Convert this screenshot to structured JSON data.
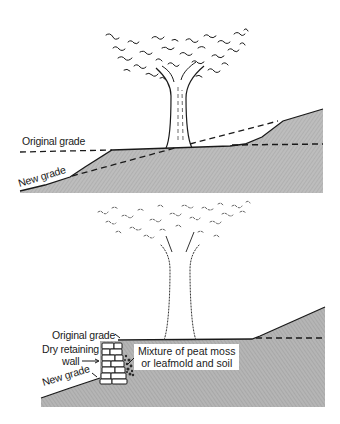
{
  "figure": {
    "type": "cross-section illustration",
    "panels": [
      {
        "id": "top",
        "description": "Tree on slope with grade lowered (cut); soil kept at original grade around trunk",
        "labels": {
          "original_grade": "Original grade",
          "new_grade": "New grade"
        }
      },
      {
        "id": "bottom",
        "description": "Tree with grade lowered; dry retaining wall holds original grade near trunk",
        "labels": {
          "original_grade": "Original grade",
          "retaining_wall_line1": "Dry retaining",
          "retaining_wall_line2": "wall",
          "new_grade": "New grade",
          "mixture_line1": "Mixture of peat moss",
          "mixture_line2": "or leafmold and soil"
        }
      }
    ],
    "colors": {
      "soil_fill": "#b9b9b9",
      "line": "#1a1a1a",
      "background": "#ffffff"
    }
  }
}
